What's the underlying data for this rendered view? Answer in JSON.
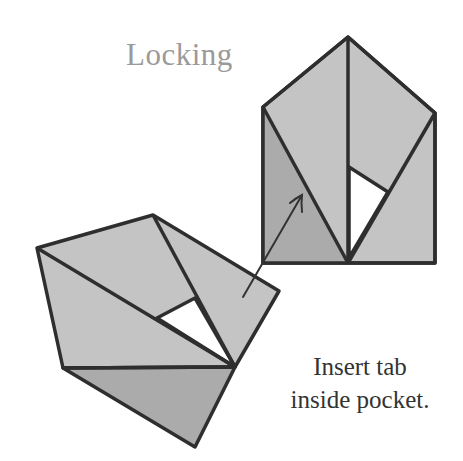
{
  "title": "Locking",
  "caption": {
    "line1": "Insert tab",
    "line2": "inside pocket."
  },
  "colors": {
    "paper_light": "#c4c4c4",
    "paper_dark": "#ababab",
    "pocket": "#ffffff",
    "outline": "#2e2e2e",
    "title": "#9a9a9a",
    "caption": "#333333"
  },
  "diagram": {
    "top_piece": "upright folded unit with pocket",
    "bottom_piece": "tilted folded unit with tab",
    "arrow": "insert tab into pocket"
  }
}
